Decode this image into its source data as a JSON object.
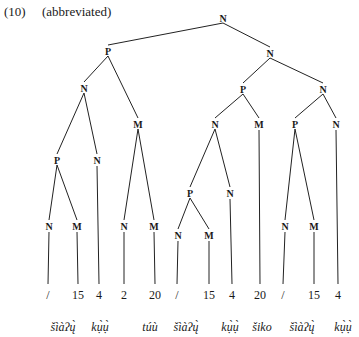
{
  "caption": {
    "number": "(10)",
    "note": "(abbreviated)"
  },
  "tree": {
    "nodes": [
      {
        "id": "n0",
        "label": "N",
        "x": 223,
        "y": 18
      },
      {
        "id": "n1",
        "label": "P",
        "x": 108,
        "y": 51
      },
      {
        "id": "n2",
        "label": "N",
        "x": 270,
        "y": 53
      },
      {
        "id": "n3",
        "label": "N",
        "x": 84,
        "y": 88
      },
      {
        "id": "n4",
        "label": "M",
        "x": 138,
        "y": 124
      },
      {
        "id": "n5",
        "label": "P",
        "x": 243,
        "y": 89
      },
      {
        "id": "n6",
        "label": "N",
        "x": 323,
        "y": 89
      },
      {
        "id": "n7",
        "label": "P",
        "x": 57,
        "y": 160
      },
      {
        "id": "n8",
        "label": "N",
        "x": 97,
        "y": 160
      },
      {
        "id": "n9",
        "label": "N",
        "x": 124,
        "y": 226
      },
      {
        "id": "n10",
        "label": "M",
        "x": 154,
        "y": 226
      },
      {
        "id": "n11",
        "label": "N",
        "x": 215,
        "y": 124
      },
      {
        "id": "n12",
        "label": "M",
        "x": 259,
        "y": 124
      },
      {
        "id": "n13",
        "label": "P",
        "x": 295,
        "y": 124
      },
      {
        "id": "n14",
        "label": "N",
        "x": 336,
        "y": 124
      },
      {
        "id": "n15",
        "label": "N",
        "x": 49,
        "y": 226
      },
      {
        "id": "n16",
        "label": "M",
        "x": 77,
        "y": 226
      },
      {
        "id": "n17",
        "label": "P",
        "x": 190,
        "y": 193
      },
      {
        "id": "n18",
        "label": "N",
        "x": 230,
        "y": 193
      },
      {
        "id": "n19",
        "label": "N",
        "x": 178,
        "y": 235
      },
      {
        "id": "n20",
        "label": "M",
        "x": 209,
        "y": 235
      },
      {
        "id": "n21",
        "label": "N",
        "x": 285,
        "y": 226
      },
      {
        "id": "n22",
        "label": "M",
        "x": 314,
        "y": 226
      }
    ],
    "edges": [
      [
        "n0",
        "n1"
      ],
      [
        "n0",
        "n2"
      ],
      [
        "n1",
        "n3"
      ],
      [
        "n1",
        "n4"
      ],
      [
        "n2",
        "n5"
      ],
      [
        "n2",
        "n6"
      ],
      [
        "n3",
        "n7"
      ],
      [
        "n3",
        "n8"
      ],
      [
        "n4",
        "n9"
      ],
      [
        "n4",
        "n10"
      ],
      [
        "n5",
        "n11"
      ],
      [
        "n5",
        "n12"
      ],
      [
        "n6",
        "n13"
      ],
      [
        "n6",
        "n14"
      ],
      [
        "n7",
        "n15"
      ],
      [
        "n7",
        "n16"
      ],
      [
        "n11",
        "n17"
      ],
      [
        "n11",
        "n18"
      ],
      [
        "n17",
        "n19"
      ],
      [
        "n17",
        "n20"
      ],
      [
        "n13",
        "n21"
      ],
      [
        "n13",
        "n22"
      ]
    ],
    "leaves": [
      {
        "parent": "n15",
        "label": "/",
        "x": 48
      },
      {
        "parent": "n16",
        "label": "15",
        "x": 78
      },
      {
        "parent": "n8",
        "label": "4",
        "x": 99
      },
      {
        "parent": "n9",
        "label": "2",
        "x": 124
      },
      {
        "parent": "n10",
        "label": "20",
        "x": 155
      },
      {
        "parent": "n19",
        "label": "/",
        "x": 177
      },
      {
        "parent": "n20",
        "label": "15",
        "x": 209
      },
      {
        "parent": "n18",
        "label": "4",
        "x": 232
      },
      {
        "parent": "n12",
        "label": "20",
        "x": 260
      },
      {
        "parent": "n21",
        "label": "/",
        "x": 283
      },
      {
        "parent": "n22",
        "label": "15",
        "x": 314
      },
      {
        "parent": "n14",
        "label": "4",
        "x": 338
      }
    ],
    "leaf_y": 299,
    "line_end_y": 284
  },
  "words": [
    {
      "text": "šìàʔų̀",
      "x": 63
    },
    {
      "text": "kụ̀ụ̀",
      "x": 100
    },
    {
      "text": "túù",
      "x": 150
    },
    {
      "text": "šìàʔų̀",
      "x": 186
    },
    {
      "text": "kụ̀ụ̀",
      "x": 230
    },
    {
      "text": "šiko",
      "x": 262
    },
    {
      "text": "šìàʔų̀",
      "x": 302
    },
    {
      "text": "kụ̀ụ̀",
      "x": 343
    }
  ],
  "word_y": 331
}
